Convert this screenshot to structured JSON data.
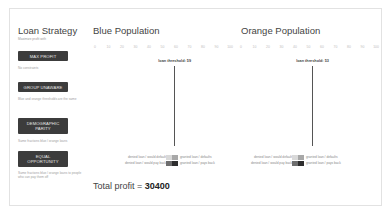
{
  "sidebar": {
    "title": "Loan Strategy",
    "subtitle": "Maximize profit with",
    "options": [
      {
        "label": "MAX PROFIT",
        "description": "No constraints"
      },
      {
        "label": "GROUP UNAWARE",
        "description": "Blue and orange thresholds are the same"
      },
      {
        "label": "DEMOGRAPHIC PARITY",
        "description": "Same fractions blue / orange loans"
      },
      {
        "label": "EQUAL OPPORTUNITY",
        "description": "Same fractions blue / orange loans to people who can pay them off"
      }
    ]
  },
  "populations": [
    {
      "title": "Blue Population",
      "threshold_label": "loan threshold: 59",
      "threshold": 59
    },
    {
      "title": "Orange Population",
      "threshold_label": "loan threshold: 53",
      "threshold": 53
    }
  ],
  "axis": {
    "ticks": [
      "0",
      "10",
      "20",
      "30",
      "40",
      "50",
      "60",
      "70",
      "80",
      "90",
      "100"
    ]
  },
  "legend": {
    "denied_default": "denied loan / would default",
    "denied_payback": "denied loan / would pay back",
    "granted_default": "granted loan / defaults",
    "granted_payback": "granted loan / pays back"
  },
  "colors": {
    "default_light": "#d9d9d9",
    "default_granted": "#a8a8a8",
    "payback_denied": "#6e6e6e",
    "payback_granted": "#2e2e2e",
    "button_bg": "#3c3c3c"
  },
  "profit": {
    "label": "Total profit = ",
    "value": "30400"
  },
  "chart_data": [
    {
      "type": "bar",
      "title": "Blue Population",
      "xlabel": "credit score",
      "xlim": [
        0,
        100
      ],
      "threshold": 59,
      "bins": [
        20,
        25,
        30,
        35,
        40,
        45,
        50,
        55,
        60,
        65,
        70,
        75,
        80,
        85,
        90
      ],
      "series": [
        {
          "name": "would default",
          "values": [
            1,
            1,
            2,
            4,
            6,
            8,
            9,
            9,
            7,
            5,
            3,
            2,
            1,
            0,
            0
          ]
        },
        {
          "name": "would pay back",
          "values": [
            0,
            0,
            0,
            0,
            1,
            2,
            3,
            5,
            7,
            8,
            7,
            5,
            4,
            2,
            1
          ]
        }
      ]
    },
    {
      "type": "bar",
      "title": "Orange Population",
      "xlabel": "credit score",
      "xlim": [
        0,
        100
      ],
      "threshold": 53,
      "bins": [
        10,
        15,
        20,
        25,
        30,
        35,
        40,
        45,
        50,
        55,
        60,
        65,
        70,
        75,
        80,
        85
      ],
      "series": [
        {
          "name": "would default",
          "values": [
            1,
            2,
            3,
            4,
            5,
            6,
            7,
            7,
            6,
            5,
            4,
            3,
            2,
            1,
            0,
            0
          ]
        },
        {
          "name": "would pay back",
          "values": [
            0,
            0,
            0,
            0,
            1,
            1,
            2,
            3,
            5,
            6,
            6,
            5,
            4,
            3,
            2,
            1
          ]
        }
      ]
    }
  ]
}
